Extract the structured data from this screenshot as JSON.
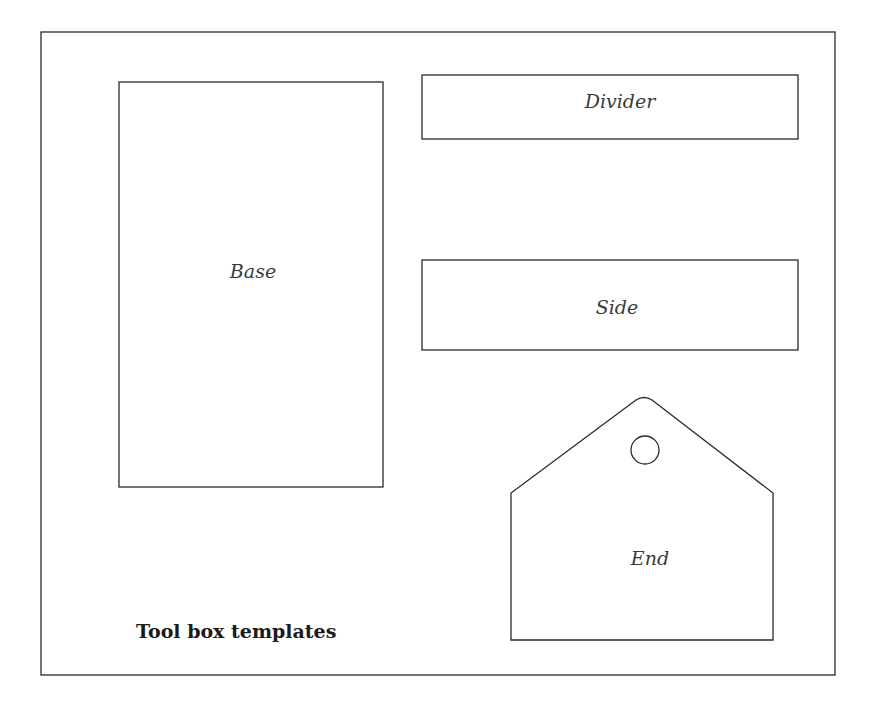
{
  "diagram": {
    "caption": "Tool box templates",
    "pieces": [
      {
        "id": "base",
        "label": "Base",
        "shape": "rectangle"
      },
      {
        "id": "divider",
        "label": "Divider",
        "shape": "rectangle"
      },
      {
        "id": "side",
        "label": "Side",
        "shape": "rectangle"
      },
      {
        "id": "end",
        "label": "End",
        "shape": "pentagon-with-hole"
      }
    ]
  },
  "colors": {
    "background": "#ffffff",
    "stroke": "#2a2a2a",
    "label": "#3a3a3a"
  }
}
